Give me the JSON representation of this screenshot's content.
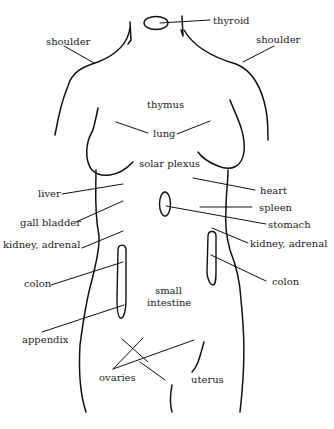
{
  "diagram": {
    "type": "anatomical-body-map",
    "line_color": "#111111",
    "text_color": "#222222",
    "background": "#ffffff",
    "labels": {
      "thyroid": "thyroid",
      "shoulder_left": "shoulder",
      "shoulder_right": "shoulder",
      "thymus": "thymus",
      "lung": "lung",
      "solar_plexus": "solar plexus",
      "liver": "liver",
      "heart": "heart",
      "spleen": "spleen",
      "gall_bladder": "gall bladder",
      "stomach": "stomach",
      "kidney_adrenal_left": "kidney, adrenal",
      "kidney_adrenal_right": "kidney, adrenal",
      "colon_left": "colon",
      "colon_right": "colon",
      "small_intestine_line1": "small",
      "small_intestine_line2": "intestine",
      "appendix": "appendix",
      "ovaries": "ovaries",
      "uterus": "uterus"
    }
  }
}
